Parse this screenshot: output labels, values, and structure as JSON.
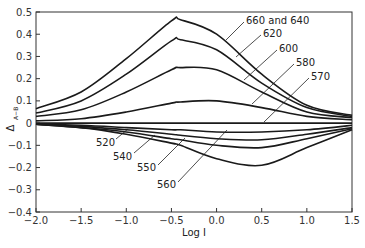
{
  "chart_data": {
    "type": "line",
    "title": "",
    "xlabel": "Log I",
    "ylabel": "Δ_{A−B}",
    "xlim": [
      -2.0,
      1.5
    ],
    "ylim": [
      -0.4,
      0.5
    ],
    "grid": false,
    "legend_position": "inline-labels",
    "x_ticks": [
      "−2.0",
      "−1.5",
      "−1.0",
      "−0.5",
      "0.0",
      "0.5",
      "1.0",
      "1.5"
    ],
    "y_ticks": [
      "0.5",
      "0.4",
      "0.3",
      "0.2",
      "0.1",
      "0",
      "−0.1",
      "−0.2",
      "−0.3",
      "−0.4"
    ],
    "x": [
      -2.0,
      -1.5,
      -1.0,
      -0.5,
      -0.4,
      0.0,
      0.5,
      1.0,
      1.5
    ],
    "series": [
      {
        "name": "660 and 640",
        "values": [
          0.065,
          0.14,
          0.29,
          0.46,
          0.465,
          0.4,
          0.22,
          0.08,
          0.035
        ]
      },
      {
        "name": "620",
        "values": [
          0.045,
          0.1,
          0.22,
          0.37,
          0.375,
          0.33,
          0.18,
          0.07,
          0.03
        ]
      },
      {
        "name": "600",
        "values": [
          0.03,
          0.06,
          0.14,
          0.24,
          0.25,
          0.24,
          0.14,
          0.05,
          0.025
        ]
      },
      {
        "name": "580",
        "values": [
          0.01,
          0.02,
          0.05,
          0.09,
          0.095,
          0.1,
          0.07,
          0.03,
          0.015
        ]
      },
      {
        "name": "570",
        "values": [
          0.0,
          0.0,
          0.0,
          0.0,
          0.0,
          0.0,
          0.0,
          0.0,
          0.0
        ]
      },
      {
        "name": "520",
        "values": [
          -0.005,
          -0.01,
          -0.02,
          -0.03,
          -0.03,
          -0.04,
          -0.04,
          -0.03,
          -0.01
        ]
      },
      {
        "name": "540",
        "values": [
          -0.005,
          -0.015,
          -0.03,
          -0.05,
          -0.055,
          -0.07,
          -0.075,
          -0.05,
          -0.02
        ]
      },
      {
        "name": "550",
        "values": [
          -0.005,
          -0.02,
          -0.04,
          -0.07,
          -0.075,
          -0.1,
          -0.11,
          -0.07,
          -0.025
        ]
      },
      {
        "name": "560",
        "values": [
          -0.005,
          -0.02,
          -0.05,
          -0.09,
          -0.1,
          -0.16,
          -0.19,
          -0.11,
          -0.03
        ]
      }
    ],
    "annotations": [
      {
        "text": "660 and 640",
        "series": "660 and 640"
      },
      {
        "text": "620",
        "series": "620"
      },
      {
        "text": "600",
        "series": "600"
      },
      {
        "text": "580",
        "series": "580"
      },
      {
        "text": "570",
        "series": "570"
      },
      {
        "text": "520",
        "series": "520"
      },
      {
        "text": "540",
        "series": "540"
      },
      {
        "text": "550",
        "series": "550"
      },
      {
        "text": "560",
        "series": "560"
      }
    ]
  },
  "axes": {
    "x_title": "Log I",
    "y_title_main": "Δ",
    "y_title_sub": "A−B"
  },
  "colors": {
    "line": "#1a1a1a",
    "axis": "#333333",
    "background": "#ffffff"
  }
}
